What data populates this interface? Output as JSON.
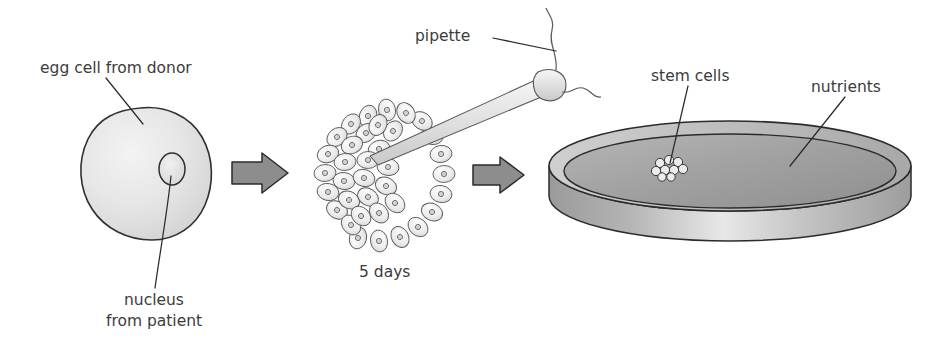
{
  "diagram": {
    "background_color": "#ffffff",
    "text_color": "#3c3c3c",
    "arrow_fill": "#8d8d8d",
    "arrow_stroke": "#2b2b2b"
  },
  "labels": {
    "egg_cell": "egg cell from donor",
    "nucleus_line1": "nucleus",
    "nucleus_line2": "from patient",
    "pipette": "pipette",
    "five_days": "5 days",
    "stem_cells": "stem cells",
    "nutrients": "nutrients"
  },
  "stages": [
    {
      "id": "stage-egg-cell",
      "name": "egg cell from donor",
      "label": "egg cell from donor",
      "sublabel": "nucleus from patient",
      "description": "Irregular round egg cell with a small oval nucleus on its right side"
    },
    {
      "id": "stage-blastocyst",
      "name": "blastocyst",
      "label": "5 days",
      "sublabel": "pipette",
      "description": "Ring of cells with dense inner cell mass, pipette extracting cells from upper right"
    },
    {
      "id": "stage-petri-dish",
      "name": "petri dish culture",
      "label": "stem cells",
      "sublabel": "nutrients",
      "description": "Elliptical petri dish containing nutrient medium and a small cluster of stem cells"
    }
  ],
  "arrows": [
    {
      "id": "arrow-1",
      "from": "egg cell",
      "to": "blastocyst"
    },
    {
      "id": "arrow-2",
      "from": "blastocyst",
      "to": "petri dish"
    }
  ]
}
